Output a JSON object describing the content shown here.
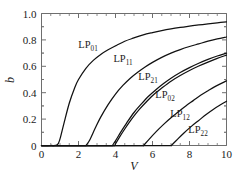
{
  "chart_data": {
    "type": "line",
    "title": "",
    "xlabel": "V",
    "ylabel": "b",
    "xlim": [
      0,
      10
    ],
    "ylim": [
      0,
      1.0
    ],
    "xticks": [
      0,
      2,
      4,
      6,
      8,
      10
    ],
    "xtick_labels": [
      "0",
      "2",
      "4",
      "6",
      "8",
      "10"
    ],
    "yticks": [
      0,
      0.2,
      0.4,
      0.6,
      0.8,
      1.0
    ],
    "ytick_labels": [
      "0",
      "0.2",
      "0.4",
      "0.6",
      "0.8",
      "1.0"
    ],
    "x_minor_interval": 0.5,
    "y_minor_interval": 0.1,
    "grid": false,
    "legend": "inline-labels",
    "series": [
      {
        "name": "LP01",
        "label_text": "LP",
        "label_sub": "01",
        "cutoff_V": 0.0,
        "onset_V": 0.85,
        "x": [
          0.0,
          0.5,
          0.85,
          1.0,
          1.2,
          1.5,
          1.8,
          2.0,
          2.4,
          2.8,
          3.2,
          3.6,
          4.0,
          4.5,
          5.0,
          5.5,
          6.0,
          6.5,
          7.0,
          7.5,
          8.0,
          8.5,
          9.0,
          9.5,
          10.0
        ],
        "y": [
          0.0,
          0.0,
          0.005,
          0.05,
          0.16,
          0.32,
          0.44,
          0.5,
          0.585,
          0.645,
          0.69,
          0.725,
          0.755,
          0.79,
          0.815,
          0.838,
          0.855,
          0.87,
          0.883,
          0.894,
          0.904,
          0.913,
          0.921,
          0.929,
          0.937
        ]
      },
      {
        "name": "LP11",
        "label_text": "LP",
        "label_sub": "11",
        "cutoff_V": 2.405,
        "onset_V": 2.4,
        "x": [
          2.405,
          2.6,
          2.9,
          3.2,
          3.6,
          4.0,
          4.4,
          4.8,
          5.2,
          5.6,
          6.0,
          6.5,
          7.0,
          7.5,
          8.0,
          8.5,
          9.0,
          9.5,
          10.0
        ],
        "y": [
          0.0,
          0.04,
          0.13,
          0.215,
          0.31,
          0.39,
          0.455,
          0.51,
          0.555,
          0.595,
          0.63,
          0.668,
          0.7,
          0.727,
          0.75,
          0.77,
          0.79,
          0.807,
          0.822
        ]
      },
      {
        "name": "LP21",
        "label_text": "LP",
        "label_sub": "21",
        "cutoff_V": 3.832,
        "onset_V": 3.83,
        "x": [
          3.832,
          4.0,
          4.3,
          4.6,
          5.0,
          5.4,
          5.8,
          6.2,
          6.6,
          7.0,
          7.5,
          8.0,
          8.5,
          9.0,
          9.5,
          10.0
        ],
        "y": [
          0.0,
          0.035,
          0.105,
          0.17,
          0.25,
          0.315,
          0.375,
          0.425,
          0.47,
          0.51,
          0.553,
          0.59,
          0.623,
          0.652,
          0.678,
          0.7
        ]
      },
      {
        "name": "LP02",
        "label_text": "LP",
        "label_sub": "02",
        "cutoff_V": 3.832,
        "onset_V": 4.0,
        "x": [
          3.95,
          4.2,
          4.5,
          4.9,
          5.3,
          5.7,
          6.1,
          6.5,
          7.0,
          7.5,
          8.0,
          8.5,
          9.0,
          9.5,
          10.0
        ],
        "y": [
          0.0,
          0.06,
          0.125,
          0.205,
          0.275,
          0.335,
          0.39,
          0.435,
          0.487,
          0.53,
          0.568,
          0.602,
          0.632,
          0.66,
          0.685
        ]
      },
      {
        "name": "LP12",
        "label_text": "LP",
        "label_sub": "12",
        "cutoff_V": 5.52,
        "onset_V": 5.5,
        "x": [
          5.52,
          5.8,
          6.2,
          6.6,
          7.0,
          7.4,
          7.8,
          8.2,
          8.6,
          9.0,
          9.4,
          10.0
        ],
        "y": [
          0.0,
          0.045,
          0.105,
          0.16,
          0.21,
          0.255,
          0.3,
          0.34,
          0.38,
          0.415,
          0.448,
          0.49
        ]
      },
      {
        "name": "LP22",
        "label_text": "LP",
        "label_sub": "22",
        "cutoff_V": 7.016,
        "onset_V": 7.0,
        "x": [
          7.016,
          7.3,
          7.7,
          8.1,
          8.5,
          8.9,
          9.3,
          9.7,
          10.0
        ],
        "y": [
          0.0,
          0.04,
          0.095,
          0.145,
          0.19,
          0.235,
          0.275,
          0.31,
          0.335
        ]
      }
    ],
    "annotations": [
      {
        "text": "LP",
        "sub": "01",
        "x_px": 88,
        "y_px": 48
      },
      {
        "text": "LP",
        "sub": "11",
        "x_px": 123,
        "y_px": 62
      },
      {
        "text": "LP",
        "sub": "21",
        "x_px": 148,
        "y_px": 80
      },
      {
        "text": "LP",
        "sub": "02",
        "x_px": 165,
        "y_px": 98
      },
      {
        "text": "LP",
        "sub": "12",
        "x_px": 180,
        "y_px": 117
      },
      {
        "text": "LP",
        "sub": "22",
        "x_px": 198,
        "y_px": 133
      }
    ],
    "colors": {
      "curve": "#111111",
      "axis": "#6e6e6e",
      "text": "#1a1a1a",
      "background": "#ffffff"
    }
  }
}
